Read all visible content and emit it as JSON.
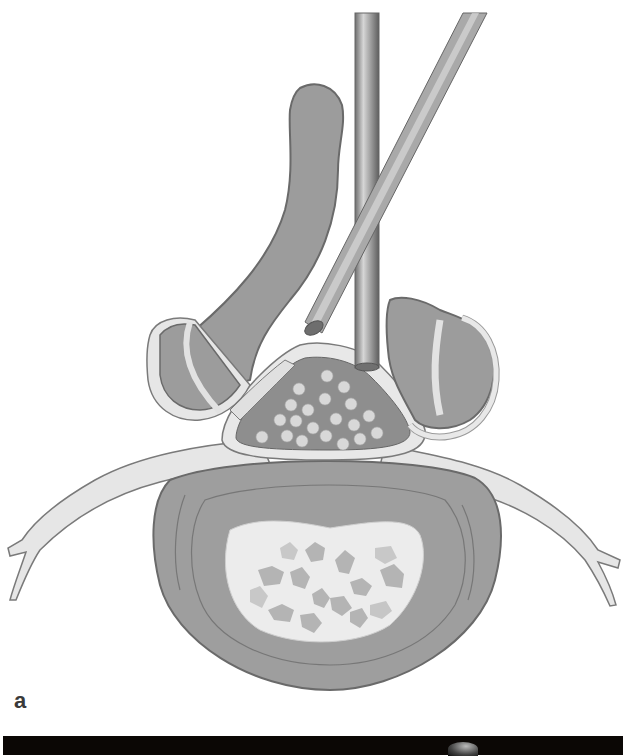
{
  "figure": {
    "panel_label": "a",
    "colors": {
      "bone_fill": "#9c9c9c",
      "bone_outline": "#6a6a6a",
      "light_tissue": "#e4e4e4",
      "nucleus_fill": "#ececec",
      "fragment_fill": "#b8b8b8",
      "canal_fill": "#8e8e8e",
      "nerve_dots": "#d8d8d8",
      "instrument": "#9a9a9a",
      "background": "#ffffff",
      "bottom_strip": "#0b0705"
    },
    "elements": [
      {
        "name": "vertical-instrument"
      },
      {
        "name": "oblique-instrument"
      },
      {
        "name": "spinous-process-left-lamina"
      },
      {
        "name": "left-facet-joint"
      },
      {
        "name": "right-facet-joint"
      },
      {
        "name": "spinal-canal-with-cauda-equina"
      },
      {
        "name": "left-nerve-root"
      },
      {
        "name": "right-nerve-root"
      },
      {
        "name": "intervertebral-disc"
      },
      {
        "name": "nucleus-pulposus-fragments"
      }
    ]
  }
}
